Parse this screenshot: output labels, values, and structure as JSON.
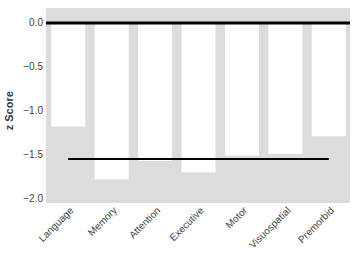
{
  "chart_data": {
    "type": "bar",
    "title": "",
    "xlabel": "",
    "ylabel": "z Score",
    "ylim": [
      -2.05,
      0.17
    ],
    "yticks": [
      0.0,
      -0.5,
      -1.0,
      -1.5,
      -2.0
    ],
    "ytick_labels": [
      "0.0",
      "−0.5",
      "−1.0",
      "−1.5",
      "−2.0"
    ],
    "categories": [
      "Language",
      "Memory",
      "Attention",
      "Executive",
      "Motor",
      "Visuospatial",
      "Premorbid"
    ],
    "values": [
      -1.18,
      -1.78,
      -1.57,
      -1.7,
      -1.51,
      -1.49,
      -1.29
    ],
    "reference_lines": [
      {
        "name": "zero-line",
        "y": 0.0,
        "color": "#000000",
        "width": 3
      },
      {
        "name": "mean-line",
        "y": -1.55,
        "color": "#000000",
        "width": 2,
        "x_start_category": "Language",
        "x_end_category": "Premorbid"
      }
    ],
    "grid": false,
    "legend": null,
    "colors": {
      "background": "#dcdcdc",
      "bar": "#ffffff",
      "lines": "#000000"
    }
  }
}
